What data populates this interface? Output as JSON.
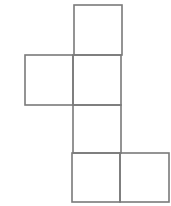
{
  "diagram": {
    "type": "cube-net",
    "stroke_color": "#7a7a7a",
    "stroke_width": 1.6,
    "background": "#ffffff",
    "square_count": 6,
    "faces": [
      {
        "id": "top",
        "x": 74,
        "y": 5,
        "w": 48,
        "h": 50
      },
      {
        "id": "left",
        "x": 25,
        "y": 55,
        "w": 48,
        "h": 50
      },
      {
        "id": "center-1",
        "x": 73,
        "y": 55,
        "w": 48,
        "h": 50
      },
      {
        "id": "center-2",
        "x": 73,
        "y": 105,
        "w": 48,
        "h": 48
      },
      {
        "id": "bottom-left",
        "x": 72,
        "y": 153,
        "w": 48,
        "h": 49
      },
      {
        "id": "bottom-right",
        "x": 120,
        "y": 153,
        "w": 49,
        "h": 49
      }
    ]
  }
}
